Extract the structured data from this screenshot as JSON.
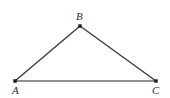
{
  "figure": {
    "kind": "geometry-diagram",
    "shape": "triangle",
    "name": "Triangle ABC",
    "canvas": {
      "width": 170,
      "height": 98
    },
    "background_color": "#ffffff",
    "stroke_color": "#3a3a3a",
    "base_stroke_color": "#6b6b6b",
    "vertex_marker_color": "#1a1a1a",
    "label_color": "#2b2b2b"
  },
  "vertices": [
    {
      "id": "A",
      "label": "A",
      "x": 15,
      "y": 81,
      "label_x": 12,
      "label_y": 85
    },
    {
      "id": "B",
      "label": "B",
      "x": 80,
      "y": 26,
      "label_x": 76,
      "label_y": 11
    },
    {
      "id": "C",
      "label": "C",
      "x": 156,
      "y": 81,
      "label_x": 152,
      "label_y": 85
    }
  ],
  "edges": [
    {
      "id": "AB",
      "from": "A",
      "to": "B",
      "x1": 15,
      "y1": 81,
      "x2": 80,
      "y2": 26,
      "width": 1.4,
      "color": "#3a3a3a"
    },
    {
      "id": "BC",
      "from": "B",
      "to": "C",
      "x1": 80,
      "y1": 26,
      "x2": 156,
      "y2": 81,
      "width": 1.4,
      "color": "#3a3a3a"
    },
    {
      "id": "AC",
      "from": "A",
      "to": "C",
      "x1": 15,
      "y1": 81,
      "x2": 156,
      "y2": 81,
      "width": 1.5,
      "color": "#6b6b6b"
    }
  ]
}
